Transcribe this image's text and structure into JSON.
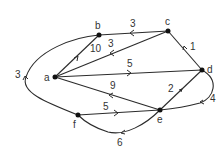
{
  "diagram": {
    "type": "weighted-directed-graph",
    "nodes": [
      {
        "id": "a",
        "label": "a"
      },
      {
        "id": "b",
        "label": "b"
      },
      {
        "id": "c",
        "label": "c"
      },
      {
        "id": "d",
        "label": "d"
      },
      {
        "id": "e",
        "label": "e"
      },
      {
        "id": "f",
        "label": "f"
      }
    ],
    "edges": [
      {
        "from": "a",
        "to": "b",
        "weight": "10"
      },
      {
        "from": "c",
        "to": "b",
        "weight": "3"
      },
      {
        "from": "c",
        "to": "a",
        "weight": "3"
      },
      {
        "from": "a",
        "to": "d",
        "weight": "5"
      },
      {
        "from": "e",
        "to": "a",
        "weight": "9"
      },
      {
        "from": "d",
        "to": "c",
        "weight": "1"
      },
      {
        "from": "e",
        "to": "d",
        "weight": "2"
      },
      {
        "from": "d",
        "to": "e",
        "weight": "4"
      },
      {
        "from": "f",
        "to": "e",
        "weight": "5"
      },
      {
        "from": "e",
        "to": "f",
        "weight": "6"
      },
      {
        "from": "f",
        "to": "b",
        "weight": "3"
      }
    ]
  },
  "labels": {
    "a": "a",
    "b": "b",
    "c": "c",
    "d": "d",
    "e": "e",
    "f": "f",
    "w_ab": "10",
    "w_cb": "3",
    "w_ca": "3",
    "w_ad": "5",
    "w_ea": "9",
    "w_dc": "1",
    "w_ed": "2",
    "w_de": "4",
    "w_fe": "5",
    "w_ef": "6",
    "w_fb": "3"
  }
}
